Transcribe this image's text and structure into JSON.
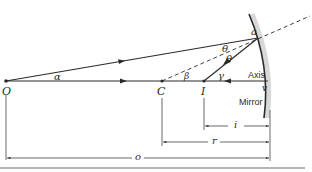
{
  "diagram": {
    "points": {
      "object": "O",
      "center": "C",
      "image": "I",
      "vertex": "v",
      "reflection_point": "a"
    },
    "angles": {
      "alpha": "α",
      "beta": "β",
      "gamma": "γ",
      "theta_incident": "θ",
      "theta_reflected": "θ"
    },
    "labels": {
      "axis": "Axis",
      "mirror": "Mirror"
    },
    "dimensions": {
      "image_distance": "i",
      "radius": "r",
      "object_distance": "o"
    },
    "colors": {
      "line": "#2a2a2a",
      "mirror_shade": "#bdbdbd",
      "rule": "#9a9a9a"
    }
  }
}
